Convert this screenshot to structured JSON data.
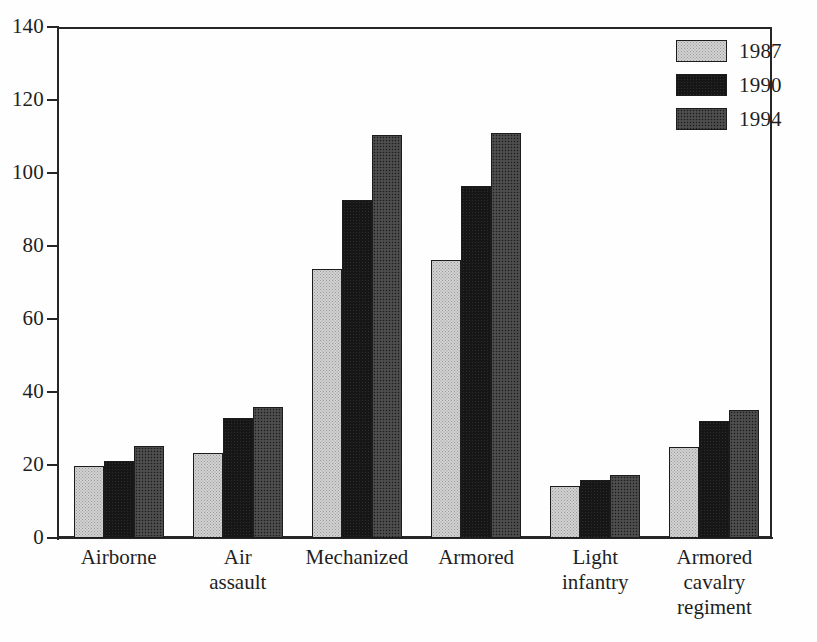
{
  "chart_data": {
    "type": "bar",
    "title": "",
    "subtitle": "",
    "xlabel": "",
    "ylabel": "",
    "ylim": [
      0,
      140
    ],
    "yticks": [
      0,
      20,
      40,
      60,
      80,
      100,
      120,
      140
    ],
    "ytick_labels": [
      "0",
      "20",
      "40",
      "60",
      "80",
      "100",
      "120",
      "140"
    ],
    "grid": false,
    "legend_position": "top-right",
    "categories": [
      "Airborne",
      "Air assault",
      "Mechanized",
      "Armored",
      "Light infantry",
      "Armored cavalry regiment"
    ],
    "category_label_lines": [
      [
        "Airborne"
      ],
      [
        "Air",
        "assault"
      ],
      [
        "Mechanized"
      ],
      [
        "Armored"
      ],
      [
        "Light",
        "infantry"
      ],
      [
        "Armored",
        "cavalry",
        "regiment"
      ]
    ],
    "series": [
      {
        "name": "1987",
        "color": "#d2d2d2",
        "pattern": "light-stipple",
        "values": [
          19.7,
          23.3,
          73.7,
          76.2,
          14.2,
          24.9
        ]
      },
      {
        "name": "1990",
        "color": "#161616",
        "pattern": "solid-black",
        "values": [
          21.2,
          33.0,
          92.6,
          96.4,
          15.8,
          32.0
        ]
      },
      {
        "name": "1994",
        "color": "#454545",
        "pattern": "dark-stipple",
        "values": [
          25.3,
          35.8,
          110.5,
          110.9,
          17.3,
          35.0
        ]
      }
    ]
  },
  "legend": {
    "entries": [
      {
        "label": "1987",
        "swatch": "fill-1987"
      },
      {
        "label": "1990",
        "swatch": "fill-1990"
      },
      {
        "label": "1994",
        "swatch": "fill-1994"
      }
    ]
  },
  "colors": {
    "axis": "#262626",
    "text": "#1f1f1f",
    "background": "#ffffff",
    "series_1987": "#d2d2d2",
    "series_1990": "#161616",
    "series_1994": "#454545"
  }
}
